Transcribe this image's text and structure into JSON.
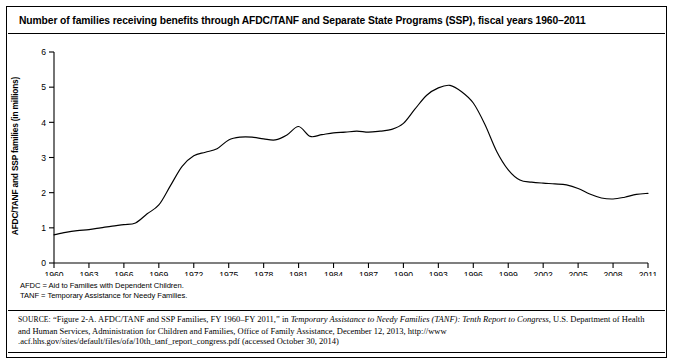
{
  "figure": {
    "title": "Number of families receiving benefits through AFDC/TANF and Separate State Programs (SSP), fiscal years 1960–2011",
    "notes": [
      "AFDC = Aid to Families with Dependent Children.",
      "TANF = Temporary Assistance for Needy Families."
    ],
    "source": {
      "label": "SOURCE:",
      "part1": " “Figure 2-A. AFDC/TANF and SSP Families, FY 1960–FY 2011,” in ",
      "italic": "Temporary Assistance to Needy Families (TANF): Tenth Report to Congress,",
      "part2": " U.S. Department of Health and Human Services, Administration for Children and Families, Office of Family Assistance, December 12, 2013, http://www .acf.hhs.gov/sites/default/files/ofa/10th_tanf_report_congress.pdf (accessed October 30, 2014)"
    }
  },
  "chart_data": {
    "type": "line",
    "title": "Number of families receiving benefits through AFDC/TANF and Separate State Programs (SSP), fiscal years 1960–2011",
    "xlabel": "",
    "ylabel": "AFDC/TANF and SSP families (in millions)",
    "xlim": [
      1960,
      2011
    ],
    "ylim": [
      0,
      6
    ],
    "yticks": [
      0,
      1,
      2,
      3,
      4,
      5,
      6
    ],
    "ytick_labels": [
      "0",
      "1",
      "2",
      "3",
      "4",
      "5",
      "6"
    ],
    "xticks": [
      1960,
      1963,
      1966,
      1969,
      1972,
      1975,
      1978,
      1981,
      1984,
      1987,
      1990,
      1993,
      1996,
      1999,
      2002,
      2005,
      2008,
      2011
    ],
    "xtick_labels": [
      "1960",
      "1963",
      "1966",
      "1969",
      "1972",
      "1975",
      "1978",
      "1981",
      "1984",
      "1987",
      "1990",
      "1993",
      "1996",
      "1999",
      "2002",
      "2005",
      "2008",
      "2011"
    ],
    "grid": false,
    "legend": false,
    "line_color": "#000000",
    "series": [
      {
        "name": "AFDC/TANF and SSP families",
        "x": [
          1960,
          1961,
          1962,
          1963,
          1964,
          1965,
          1966,
          1967,
          1968,
          1969,
          1970,
          1971,
          1972,
          1973,
          1974,
          1975,
          1976,
          1977,
          1978,
          1979,
          1980,
          1981,
          1982,
          1983,
          1984,
          1985,
          1986,
          1987,
          1988,
          1989,
          1990,
          1991,
          1992,
          1993,
          1994,
          1995,
          1996,
          1997,
          1998,
          1999,
          2000,
          2001,
          2002,
          2003,
          2004,
          2005,
          2006,
          2007,
          2008,
          2009,
          2010,
          2011
        ],
        "values": [
          0.8,
          0.87,
          0.92,
          0.95,
          1.0,
          1.05,
          1.09,
          1.14,
          1.4,
          1.65,
          2.2,
          2.75,
          3.05,
          3.15,
          3.25,
          3.5,
          3.58,
          3.58,
          3.53,
          3.5,
          3.64,
          3.88,
          3.6,
          3.65,
          3.7,
          3.72,
          3.75,
          3.72,
          3.75,
          3.8,
          3.97,
          4.38,
          4.77,
          4.98,
          5.05,
          4.87,
          4.55,
          3.94,
          3.18,
          2.65,
          2.36,
          2.3,
          2.27,
          2.25,
          2.22,
          2.12,
          1.96,
          1.85,
          1.82,
          1.87,
          1.95,
          1.98
        ]
      }
    ]
  }
}
